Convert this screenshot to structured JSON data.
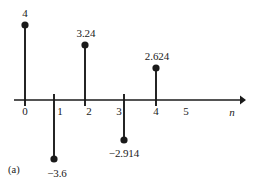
{
  "panel": {
    "label": "(a)",
    "label_x": 8,
    "label_y": 164
  },
  "axis": {
    "name": "n",
    "name_x": 232,
    "name_y": 107,
    "y": 100,
    "x_start": 14,
    "x_end": 246,
    "tick_label_y": 106,
    "tick_labels": [
      {
        "text": "0",
        "x": 25
      },
      {
        "text": "1",
        "x": 60
      },
      {
        "text": "2",
        "x": 89
      },
      {
        "text": "3",
        "x": 119
      },
      {
        "text": "4",
        "x": 156
      },
      {
        "text": "5",
        "x": 186
      }
    ]
  },
  "chart_data": {
    "type": "scatter",
    "title": "",
    "xlabel": "n",
    "ylabel": "",
    "subtitle": "",
    "grid": false,
    "legend": "none",
    "xlim": [
      -0.4,
      6.6
    ],
    "ylim": [
      -3.6,
      4
    ],
    "x": [
      0,
      1,
      2,
      3,
      4,
      5
    ],
    "values": [
      4,
      -3.6,
      3.24,
      -2.914,
      2.624,
      0
    ],
    "point_labels": [
      "4",
      "−3.6",
      "3.24",
      "−2.914",
      "2.624",
      ""
    ],
    "stems": [
      {
        "n": 0,
        "value": 4,
        "label": "4",
        "px": 25,
        "dot_y": 25,
        "label_x": 25,
        "label_y": 8,
        "label_above": true
      },
      {
        "n": 1,
        "value": -3.6,
        "label": "−3.6",
        "px": 54,
        "dot_y": 159,
        "label_x": 57,
        "label_y": 168,
        "label_above": false
      },
      {
        "n": 2,
        "value": 3.24,
        "label": "3.24",
        "px": 85,
        "dot_y": 45,
        "label_x": 86,
        "label_y": 28,
        "label_above": true
      },
      {
        "n": 3,
        "value": -2.914,
        "label": "−2.914",
        "px": 124,
        "dot_y": 140,
        "label_x": 124,
        "label_y": 148,
        "label_above": false
      },
      {
        "n": 4,
        "value": 2.624,
        "label": "2.624",
        "px": 156,
        "dot_y": 68,
        "label_x": 157,
        "label_y": 51,
        "label_above": true
      }
    ]
  },
  "colors": {
    "ink": "#1a1a1a",
    "background": "#ffffff"
  }
}
